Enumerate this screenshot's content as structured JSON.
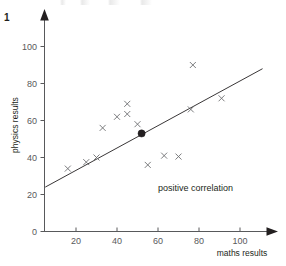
{
  "question": {
    "number": "1"
  },
  "chart_data": {
    "type": "scatter",
    "title": "",
    "xlabel": "maths results",
    "ylabel": "physics results",
    "xlim": [
      0,
      115
    ],
    "ylim": [
      0,
      108
    ],
    "xticks": [
      20,
      40,
      60,
      80,
      100
    ],
    "yticks": [
      0,
      20,
      40,
      60,
      80,
      100
    ],
    "xtick_labels": [
      "20",
      "40",
      "60",
      "80",
      "100"
    ],
    "ytick_labels": [
      "0",
      "20",
      "40",
      "60",
      "80",
      "100"
    ],
    "grid": false,
    "legend": null,
    "points": [
      {
        "x": 16,
        "y": 34,
        "marker": "cross"
      },
      {
        "x": 25,
        "y": 37.5,
        "marker": "cross"
      },
      {
        "x": 30,
        "y": 40,
        "marker": "cross"
      },
      {
        "x": 33,
        "y": 56,
        "marker": "cross"
      },
      {
        "x": 40,
        "y": 62,
        "marker": "cross"
      },
      {
        "x": 45,
        "y": 63.5,
        "marker": "cross"
      },
      {
        "x": 45,
        "y": 69,
        "marker": "cross"
      },
      {
        "x": 50,
        "y": 58,
        "marker": "cross"
      },
      {
        "x": 55,
        "y": 36,
        "marker": "cross"
      },
      {
        "x": 63,
        "y": 41,
        "marker": "cross"
      },
      {
        "x": 70,
        "y": 40.5,
        "marker": "cross"
      },
      {
        "x": 76,
        "y": 66,
        "marker": "cross"
      },
      {
        "x": 77,
        "y": 90,
        "marker": "cross"
      },
      {
        "x": 91,
        "y": 72,
        "marker": "cross"
      }
    ],
    "mean_point": {
      "x": 52,
      "y": 53,
      "marker": "filled-circle"
    },
    "trend_line": {
      "x1": 5,
      "y1": 24,
      "x2": 111,
      "y2": 88
    },
    "annotations": [
      {
        "text": "positive correlation",
        "x": 60,
        "y": 22
      }
    ]
  }
}
